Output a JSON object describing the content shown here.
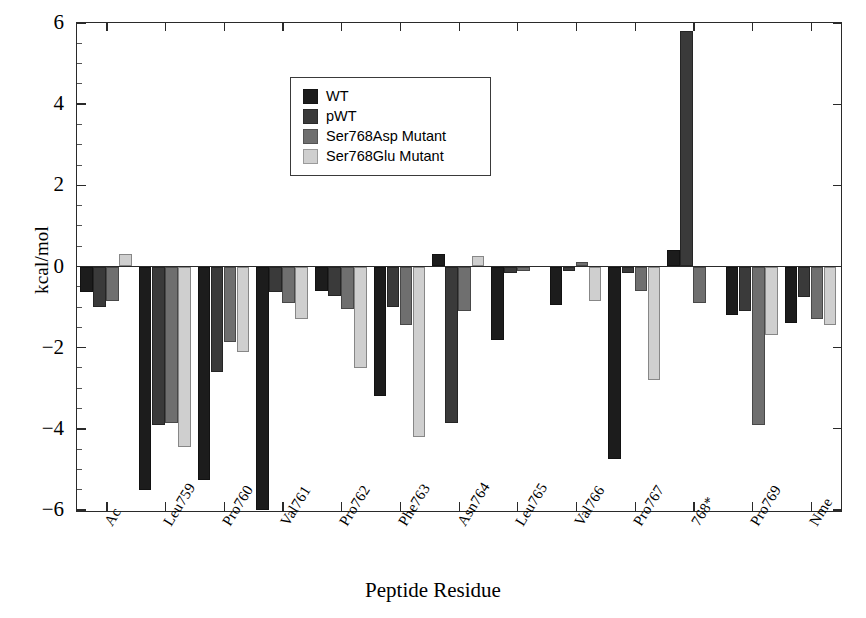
{
  "chart_data": {
    "type": "bar",
    "title": "",
    "xlabel": "Peptide Residue",
    "ylabel": "kcal/mol",
    "ylim": [
      -6,
      6
    ],
    "yticks": [
      6,
      4,
      2,
      0,
      -2,
      -4,
      -6
    ],
    "ytick_labels": [
      "6",
      "4",
      "2",
      "0",
      "-2",
      "-4",
      "-6"
    ],
    "grid": false,
    "legend_position": "upper-left-inside",
    "categories": [
      "Ac",
      "Leu759",
      "Pro760",
      "Val761",
      "Pro762",
      "Phe763",
      "Asn764",
      "Leu765",
      "Val766",
      "Pro767",
      "768*",
      "Pro769",
      "Nme"
    ],
    "series": [
      {
        "name": "WT",
        "color": "#1c1c1c",
        "values": [
          -0.62,
          -5.5,
          -5.25,
          -6.0,
          -0.6,
          -3.2,
          0.3,
          -1.8,
          -0.95,
          -4.75,
          0.4,
          -1.2,
          -1.4
        ]
      },
      {
        "name": "pWT",
        "color": "#3a3a3a",
        "values": [
          -1.0,
          -3.9,
          -2.6,
          -0.62,
          -0.72,
          -1.0,
          -3.85,
          -0.15,
          -0.1,
          -0.15,
          5.8,
          -1.1,
          -0.75
        ]
      },
      {
        "name": "Ser768Asp Mutant",
        "color": "#6f6f6f",
        "values": [
          -0.85,
          -3.85,
          -1.85,
          -0.9,
          -1.05,
          -1.45,
          -1.1,
          -0.1,
          0.12,
          -0.6,
          -0.9,
          -3.9,
          -1.3
        ]
      },
      {
        "name": "Ser768Glu Mutant",
        "color": "#cfcfcf",
        "values": [
          0.3,
          -4.45,
          -2.1,
          -1.3,
          -2.5,
          -4.2,
          0.25,
          0.0,
          -0.85,
          -2.8,
          0.0,
          -1.7,
          -1.45
        ]
      }
    ]
  },
  "legend": {
    "entries": [
      {
        "label": "WT",
        "color": "#1c1c1c"
      },
      {
        "label": "pWT",
        "color": "#3a3a3a"
      },
      {
        "label": "Ser768Asp Mutant",
        "color": "#6f6f6f"
      },
      {
        "label": "Ser768Glu Mutant",
        "color": "#cfcfcf"
      }
    ]
  },
  "axes": {
    "y_title": "kcal/mol",
    "x_title": "Peptide Residue"
  }
}
